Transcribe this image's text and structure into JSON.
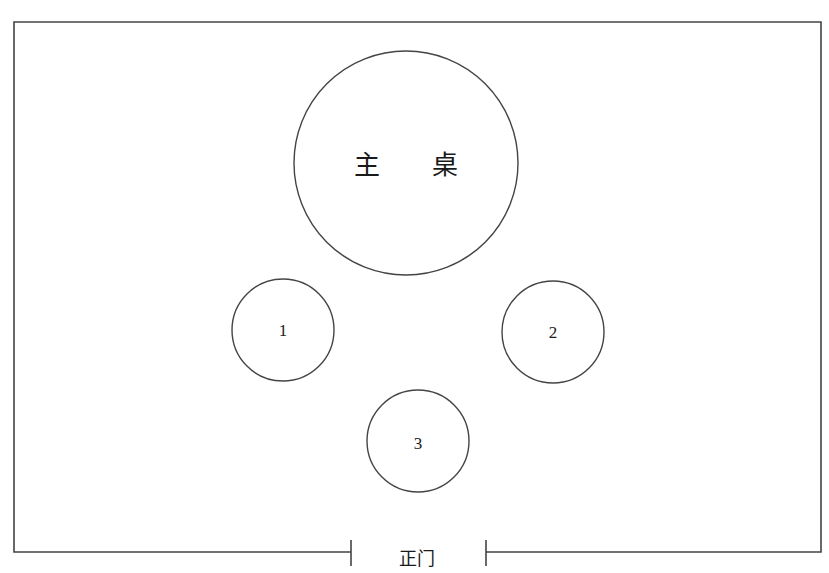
{
  "diagram": {
    "type": "seating-layout",
    "room": {
      "frame": {
        "left": 14,
        "top": 22,
        "right": 821,
        "bottom": 552
      },
      "stroke": "#444444"
    },
    "main_table": {
      "label": "主 桌",
      "cx": 406,
      "cy": 163,
      "r": 112
    },
    "tables": [
      {
        "label": "1",
        "cx": 283,
        "cy": 330,
        "r": 51
      },
      {
        "label": "2",
        "cx": 553,
        "cy": 332,
        "r": 51
      },
      {
        "label": "3",
        "cx": 418,
        "cy": 441,
        "r": 51
      }
    ],
    "door": {
      "label": "正门",
      "left_x": 351,
      "right_x": 486,
      "y": 552,
      "bracket_top": 540,
      "bracket_bottom": 566
    }
  }
}
